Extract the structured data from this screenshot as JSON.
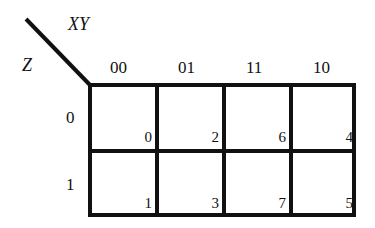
{
  "kmap": {
    "row_variable": "Z",
    "column_variables": "XY",
    "column_codes": [
      "00",
      "01",
      "11",
      "10"
    ],
    "row_codes": [
      "0",
      "1"
    ],
    "cells": [
      [
        "0",
        "2",
        "6",
        "4"
      ],
      [
        "1",
        "3",
        "7",
        "5"
      ]
    ]
  }
}
